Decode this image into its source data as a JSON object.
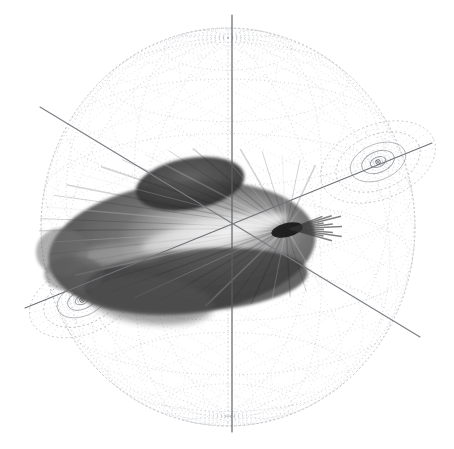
{
  "figure": {
    "background_color": "#ffffff",
    "canvas": {
      "width": 454,
      "height": 449
    }
  },
  "sphere": {
    "name": "wireframe-sphere",
    "center": {
      "x": 228,
      "y": 227
    },
    "radius_x": 187,
    "radius_y": 199,
    "stroke_color": "#b9bcc2",
    "outline_color": "#a8abb1",
    "mesh_style": "dotted",
    "mesh_dash": "1 3",
    "longitude_count": 12,
    "latitude_count": 9,
    "helix_count": 16
  },
  "axes": [
    {
      "name": "vertical-axis",
      "color": "#5d5f63",
      "x1": 232,
      "y1": 15,
      "x2": 232,
      "y2": 432,
      "width": 1.15
    },
    {
      "name": "diagonal-axis-upper-left-to-lower-right",
      "color": "#7a7d82",
      "x1": 40,
      "y1": 107,
      "x2": 420,
      "y2": 337,
      "width": 1.1
    },
    {
      "name": "diagonal-axis-lower-left-to-upper-right",
      "color": "#6f7277",
      "x1": 25,
      "y1": 308,
      "x2": 432,
      "y2": 143,
      "width": 1.1
    }
  ],
  "poles": [
    {
      "name": "upper-right-pole",
      "cx": 378,
      "cy": 162,
      "rings": [
        8,
        17,
        29,
        44,
        60
      ],
      "rotation": -22,
      "squash": 0.62,
      "color": "#8e9197"
    },
    {
      "name": "lower-left-pole",
      "cx": 82,
      "cy": 300,
      "rings": [
        7,
        15,
        26,
        40,
        55
      ],
      "rotation": -22,
      "squash": 0.62,
      "color": "#8e9197"
    }
  ],
  "lobe": {
    "name": "main-lobe-surface",
    "center": {
      "x": 182,
      "y": 248
    },
    "width": 268,
    "height": 132,
    "tone_dark": "#2f2f2f",
    "tone_mid": "#6e6e6e",
    "tone_light": "#c9c9c9",
    "tone_highlight": "#e8e8e8",
    "upper_lobe": {
      "x": 190,
      "y": 184,
      "width": 110,
      "height": 52
    },
    "right_tip": {
      "x": 306,
      "y": 232
    },
    "left_tip": {
      "x": 48,
      "y": 255
    },
    "ray_count": 34
  },
  "chart_data": {
    "type": "line",
    "subtitle": "",
    "xlabel": "",
    "ylabel": "",
    "grid": true,
    "legend": "none",
    "series": [
      {
        "name": "sphere-mesh-longitudes",
        "values": [
          12
        ]
      },
      {
        "name": "sphere-mesh-latitudes",
        "values": [
          9
        ]
      },
      {
        "name": "pole-rings-upper-right",
        "values": [
          8,
          17,
          29,
          44,
          60
        ]
      },
      {
        "name": "pole-rings-lower-left",
        "values": [
          7,
          15,
          26,
          40,
          55
        ]
      },
      {
        "name": "axis-lines",
        "values": [
          3
        ]
      }
    ]
  }
}
